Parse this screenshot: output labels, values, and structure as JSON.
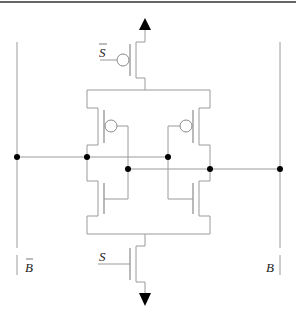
{
  "diagram": {
    "title": "",
    "type": "sense-amplifier-circuit",
    "labels": {
      "sense_enable_bar": "S",
      "sense_enable": "S",
      "bitline_bar": "B",
      "bitline": "B"
    },
    "components": [
      {
        "id": "pmos-header",
        "type": "PMOS transistor",
        "gate": "S-bar"
      },
      {
        "id": "pmos-left",
        "type": "PMOS transistor"
      },
      {
        "id": "pmos-right",
        "type": "PMOS transistor"
      },
      {
        "id": "nmos-left",
        "type": "NMOS transistor"
      },
      {
        "id": "nmos-right",
        "type": "NMOS transistor"
      },
      {
        "id": "nmos-footer",
        "type": "NMOS transistor",
        "gate": "S"
      }
    ],
    "terminals": {
      "supply": "up-arrow",
      "ground": "down-arrow"
    }
  }
}
